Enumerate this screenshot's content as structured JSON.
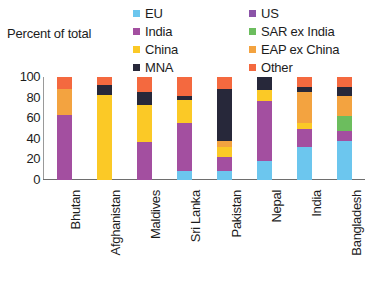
{
  "axis_title": "Percent of total",
  "legend": {
    "left_column": [
      {
        "label": "EU",
        "color": "#6cc6ee",
        "swatch_name": "legend-swatch-eu"
      },
      {
        "label": "India",
        "color": "#a34fa0",
        "swatch_name": "legend-swatch-india"
      },
      {
        "label": "China",
        "color": "#fbc926",
        "swatch_name": "legend-swatch-china"
      },
      {
        "label": "MNA",
        "color": "#27283a",
        "swatch_name": "legend-swatch-mna"
      }
    ],
    "right_column": [
      {
        "label": "US",
        "color": "#8b53a8",
        "swatch_name": "legend-swatch-us"
      },
      {
        "label": "SAR ex India",
        "color": "#6cbd5e",
        "swatch_name": "legend-swatch-sar-ex-india"
      },
      {
        "label": "EAP ex China",
        "color": "#f3a340",
        "swatch_name": "legend-swatch-eap-ex-china"
      },
      {
        "label": "Other",
        "color": "#f4693f",
        "swatch_name": "legend-swatch-other"
      }
    ]
  },
  "chart_data": {
    "type": "bar",
    "subtype": "stacked-vertical-100pct",
    "title": "",
    "xlabel": "",
    "ylabel": "Percent of total",
    "ylim": [
      0,
      100
    ],
    "yticks": [
      0,
      20,
      40,
      60,
      80,
      100
    ],
    "grid": false,
    "legend_position": "top",
    "categories": [
      "Bhutan",
      "Afghanistan",
      "Maldives",
      "Sri Lanka",
      "Pakistan",
      "Nepal",
      "India",
      "Bangladesh"
    ],
    "series": [
      {
        "name": "EU",
        "color": "#6cc6ee",
        "values": [
          0,
          0,
          0,
          9,
          9,
          18,
          32,
          38
        ]
      },
      {
        "name": "US",
        "color": "#8b53a8",
        "values": [
          0,
          0,
          0,
          0,
          0,
          0,
          0,
          0
        ]
      },
      {
        "name": "India",
        "color": "#a34fa0",
        "values": [
          63,
          0,
          37,
          46,
          13,
          59,
          18,
          10
        ]
      },
      {
        "name": "SAR ex India",
        "color": "#6cbd5e",
        "values": [
          0,
          0,
          0,
          0,
          0,
          0,
          0,
          14
        ]
      },
      {
        "name": "China",
        "color": "#fbc926",
        "values": [
          0,
          83,
          36,
          23,
          10,
          10,
          5,
          0
        ]
      },
      {
        "name": "EAP ex China",
        "color": "#f3a340",
        "values": [
          25,
          0,
          0,
          0,
          6,
          0,
          30,
          20
        ]
      },
      {
        "name": "MNA",
        "color": "#27283a",
        "values": [
          0,
          9,
          12,
          4,
          50,
          13,
          5,
          8
        ]
      },
      {
        "name": "Other",
        "color": "#f4693f",
        "values": [
          12,
          8,
          15,
          18,
          12,
          0,
          10,
          10
        ]
      }
    ],
    "stacks": [
      {
        "category": "Bhutan",
        "segments": [
          {
            "series": "India",
            "color": "#a34fa0",
            "value": 63
          },
          {
            "series": "EAP ex China",
            "color": "#f3a340",
            "value": 25
          },
          {
            "series": "Other",
            "color": "#f4693f",
            "value": 12
          }
        ]
      },
      {
        "category": "Afghanistan",
        "segments": [
          {
            "series": "China",
            "color": "#fbc926",
            "value": 83
          },
          {
            "series": "MNA",
            "color": "#27283a",
            "value": 9
          },
          {
            "series": "Other",
            "color": "#f4693f",
            "value": 8
          }
        ]
      },
      {
        "category": "Maldives",
        "segments": [
          {
            "series": "India",
            "color": "#a34fa0",
            "value": 37
          },
          {
            "series": "China",
            "color": "#fbc926",
            "value": 36
          },
          {
            "series": "MNA",
            "color": "#27283a",
            "value": 12
          },
          {
            "series": "Other",
            "color": "#f4693f",
            "value": 15
          }
        ]
      },
      {
        "category": "Sri Lanka",
        "segments": [
          {
            "series": "EU",
            "color": "#6cc6ee",
            "value": 9
          },
          {
            "series": "India",
            "color": "#a34fa0",
            "value": 46
          },
          {
            "series": "China",
            "color": "#fbc926",
            "value": 23
          },
          {
            "series": "MNA",
            "color": "#27283a",
            "value": 4
          },
          {
            "series": "Other",
            "color": "#f4693f",
            "value": 18
          }
        ]
      },
      {
        "category": "Pakistan",
        "segments": [
          {
            "series": "EU",
            "color": "#6cc6ee",
            "value": 9
          },
          {
            "series": "India",
            "color": "#a34fa0",
            "value": 13
          },
          {
            "series": "China",
            "color": "#fbc926",
            "value": 10
          },
          {
            "series": "EAP ex China",
            "color": "#f3a340",
            "value": 6
          },
          {
            "series": "MNA",
            "color": "#27283a",
            "value": 50
          },
          {
            "series": "Other",
            "color": "#f4693f",
            "value": 12
          }
        ]
      },
      {
        "category": "Nepal",
        "segments": [
          {
            "series": "EU",
            "color": "#6cc6ee",
            "value": 18
          },
          {
            "series": "India",
            "color": "#a34fa0",
            "value": 59
          },
          {
            "series": "China",
            "color": "#fbc926",
            "value": 10
          },
          {
            "series": "MNA",
            "color": "#27283a",
            "value": 13
          }
        ]
      },
      {
        "category": "India",
        "segments": [
          {
            "series": "EU",
            "color": "#6cc6ee",
            "value": 32
          },
          {
            "series": "India",
            "color": "#a34fa0",
            "value": 18
          },
          {
            "series": "China",
            "color": "#fbc926",
            "value": 5
          },
          {
            "series": "EAP ex China",
            "color": "#f3a340",
            "value": 30
          },
          {
            "series": "MNA",
            "color": "#27283a",
            "value": 5
          },
          {
            "series": "Other",
            "color": "#f4693f",
            "value": 10
          }
        ]
      },
      {
        "category": "Bangladesh",
        "segments": [
          {
            "series": "EU",
            "color": "#6cc6ee",
            "value": 38
          },
          {
            "series": "India",
            "color": "#a34fa0",
            "value": 10
          },
          {
            "series": "SAR ex India",
            "color": "#6cbd5e",
            "value": 14
          },
          {
            "series": "EAP ex China",
            "color": "#f3a340",
            "value": 20
          },
          {
            "series": "MNA",
            "color": "#27283a",
            "value": 8
          },
          {
            "series": "Other",
            "color": "#f4693f",
            "value": 10
          }
        ]
      }
    ]
  }
}
